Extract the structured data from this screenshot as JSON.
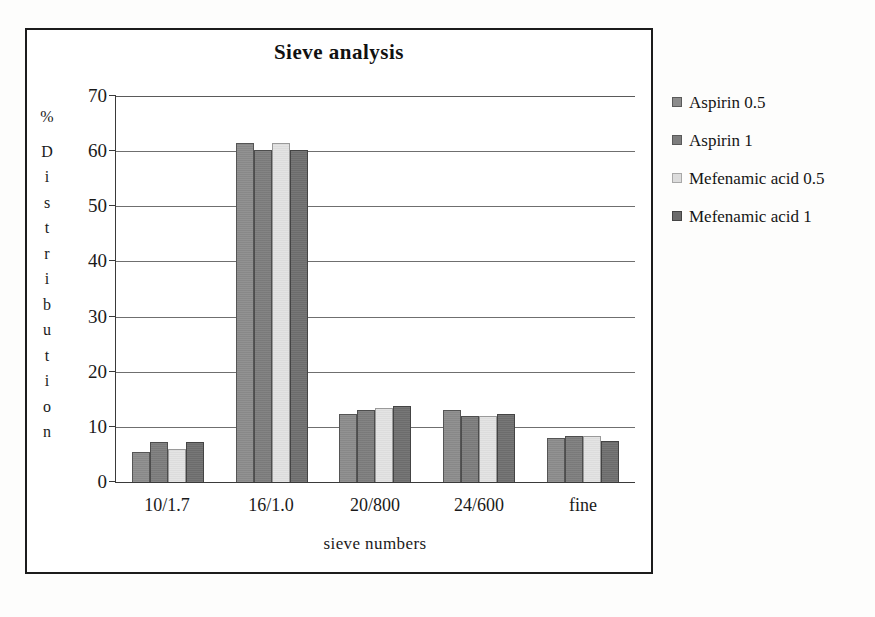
{
  "chart_data": {
    "type": "bar",
    "title": "Sieve analysis",
    "xlabel": "sieve numbers",
    "ylabel": "% Distribution",
    "ylabel_chars": [
      "%",
      "D",
      "i",
      "s",
      "t",
      "r",
      "i",
      "b",
      "u",
      "t",
      "i",
      "o",
      "n"
    ],
    "categories": [
      "10/1.7",
      "16/1.0",
      "20/800",
      "24/600",
      "fine"
    ],
    "ylim": [
      0,
      70
    ],
    "yticks": [
      0,
      10,
      20,
      30,
      40,
      50,
      60,
      70
    ],
    "grid": true,
    "legend_position": "right",
    "series": [
      {
        "name": "Aspirin 0.5",
        "color": "#8c8c8c",
        "values": [
          5.5,
          61.5,
          12.4,
          13.0,
          8.0
        ]
      },
      {
        "name": "Aspirin 1",
        "color": "#7d7d7d",
        "values": [
          7.2,
          60.3,
          13.0,
          12.0,
          8.4
        ]
      },
      {
        "name": "Mefenamic acid 0.5",
        "color": "#e2e2e2",
        "values": [
          6.0,
          61.5,
          13.5,
          12.0,
          8.3
        ]
      },
      {
        "name": "Mefenamic acid 1",
        "color": "#6f6f6f",
        "values": [
          7.2,
          60.3,
          13.8,
          12.3,
          7.4
        ]
      }
    ]
  }
}
